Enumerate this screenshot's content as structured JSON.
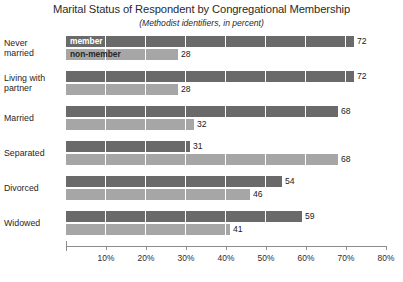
{
  "chart_data": {
    "type": "bar",
    "orientation": "horizontal",
    "grouped": true,
    "title": "Marital Status of Respondent by Congregational Membership",
    "subtitle": "(Methodist identifiers, in percent)",
    "xlabel": "",
    "ylabel": "",
    "xlim": [
      0,
      80
    ],
    "xtick_labels": [
      "10%",
      "20%",
      "30%",
      "40%",
      "50%",
      "60%",
      "70%",
      "80%"
    ],
    "xtick_values": [
      10,
      20,
      30,
      40,
      50,
      60,
      70,
      80
    ],
    "grid": "vertical-white-gridlines-over-bars",
    "legend_position": "inline-inside-first-group",
    "categories": [
      "Never married",
      "Living with partner",
      "Married",
      "Separated",
      "Divorced",
      "Widowed"
    ],
    "category_lines": [
      [
        "Never",
        "married"
      ],
      [
        "Living with",
        "partner"
      ],
      [
        "Married"
      ],
      [
        "Separated"
      ],
      [
        "Divorced"
      ],
      [
        "Widowed"
      ]
    ],
    "series": [
      {
        "name": "member",
        "color": "#6a6a6a",
        "values": [
          72,
          72,
          68,
          31,
          54,
          59
        ]
      },
      {
        "name": "non-member",
        "color": "#a6a6a6",
        "values": [
          28,
          28,
          32,
          68,
          46,
          41
        ]
      }
    ]
  },
  "colors": {
    "member": "#6a6a6a",
    "non_member": "#a6a6a6",
    "axis": "#8c8c8c",
    "background": "#ffffff",
    "text": "#1a1a1a"
  }
}
